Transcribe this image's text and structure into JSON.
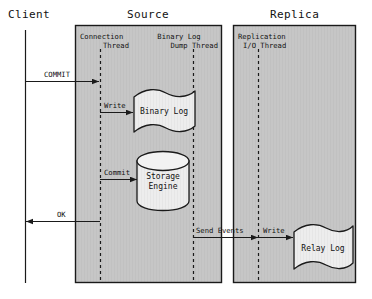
{
  "diagram": {
    "lanes": [
      {
        "id": "client",
        "label": "Client",
        "title_x": 8,
        "title_y": 8,
        "has_box": false
      },
      {
        "id": "source",
        "label": "Source",
        "title_x": 130,
        "title_y": 8,
        "has_box": true,
        "box_x": 75,
        "box_y": 25,
        "box_w": 147,
        "box_h": 258
      },
      {
        "id": "replica",
        "label": "Replica",
        "title_x": 272,
        "title_y": 8,
        "has_box": true,
        "box_x": 233,
        "box_y": 25,
        "box_w": 123,
        "box_h": 258
      }
    ],
    "threads": [
      {
        "id": "connection-thread",
        "lines": [
          "Connection",
          "Thread"
        ],
        "label_x": 80,
        "label_y": 33,
        "align": "left",
        "line_x": 100,
        "line_y1": 49,
        "line_y2": 280
      },
      {
        "id": "binary-log-dump-thread",
        "lines": [
          "Binary Log",
          "Dump Thread"
        ],
        "label_x": 152,
        "label_y": 33,
        "align": "right",
        "line_x": 193,
        "line_y1": 49,
        "line_y2": 280
      },
      {
        "id": "replication-io-thread",
        "lines": [
          "Replication",
          "I/O Thread"
        ],
        "label_x": 238,
        "label_y": 33,
        "align": "left",
        "line_x": 258,
        "line_y1": 49,
        "line_y2": 280
      }
    ],
    "client_line": {
      "x": 25,
      "y1": 30,
      "y2": 283
    },
    "nodes": [
      {
        "id": "binary-log",
        "shape": "flag",
        "label": "Binary Log",
        "x": 133,
        "y": 90,
        "w": 62,
        "h": 44
      },
      {
        "id": "storage-engine",
        "shape": "cylinder",
        "label": [
          "Storage",
          "Engine"
        ],
        "x": 137,
        "y": 152,
        "w": 52,
        "h": 58
      },
      {
        "id": "relay-log",
        "shape": "flag",
        "label": "Relay Log",
        "x": 293,
        "y": 225,
        "w": 60,
        "h": 46
      }
    ],
    "arrows": [
      {
        "id": "commit-arrow",
        "label": "COMMIT",
        "label_x": 46,
        "label_y": 68,
        "x1": 25,
        "y1": 81,
        "x2": 100,
        "y2": 81,
        "dir": "right"
      },
      {
        "id": "write-binlog-arrow",
        "label": "Write",
        "label_x": 104,
        "label_y": 99,
        "x1": 100,
        "y1": 112,
        "x2": 133,
        "y2": 112,
        "dir": "right"
      },
      {
        "id": "commit-se-arrow",
        "label": "Commit",
        "label_x": 104,
        "label_y": 166,
        "x1": 100,
        "y1": 179,
        "x2": 137,
        "y2": 179,
        "dir": "right"
      },
      {
        "id": "ok-arrow",
        "label": "OK",
        "label_x": 57,
        "label_y": 208,
        "x1": 100,
        "y1": 221,
        "x2": 25,
        "y2": 221,
        "dir": "left"
      },
      {
        "id": "send-events-arrow",
        "label": "Send Events",
        "label_x": 196,
        "label_y": 224,
        "x1": 193,
        "y1": 237,
        "x2": 258,
        "y2": 237,
        "dir": "right"
      },
      {
        "id": "write-relay-arrow",
        "label": "Write",
        "label_x": 263,
        "label_y": 224,
        "x1": 258,
        "y1": 237,
        "x2": 293,
        "y2": 237,
        "dir": "right"
      }
    ],
    "colors": {
      "lane_fill": "#c6c6c6",
      "lane_stroke": "#1a1a1a",
      "node_fill": "#ececec",
      "node_stroke": "#1a1a1a",
      "line": "#1a1a1a",
      "text": "#111111",
      "background": "#ffffff"
    }
  }
}
